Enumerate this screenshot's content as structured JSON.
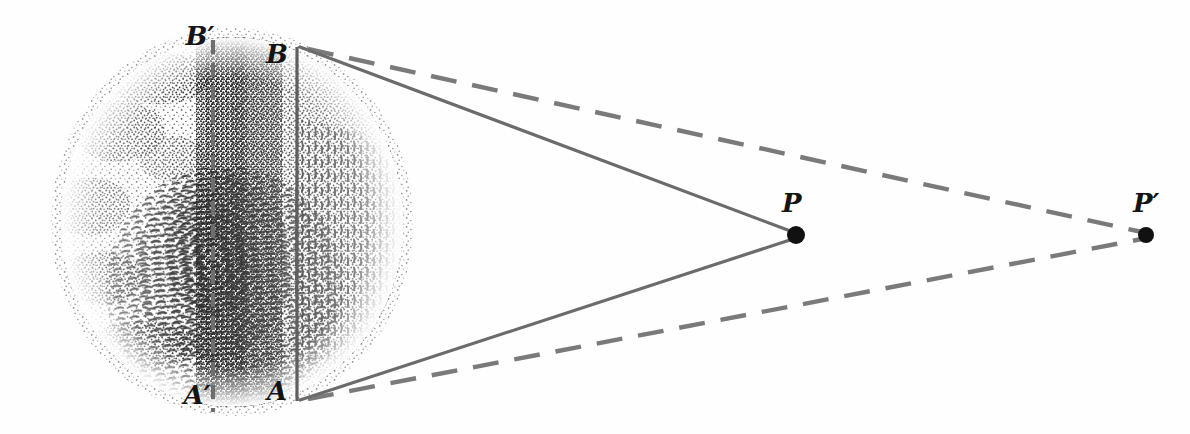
{
  "figure": {
    "background_color": "#fefefe",
    "width": 1190,
    "height": 434
  },
  "colors": {
    "line_solid": "#6b6b6b",
    "line_dashed": "#7a7a7a",
    "label_text": "#141414",
    "stipple": "#1a1a1a",
    "point_fill": "#111111"
  },
  "labels": [
    {
      "id": "B-prime",
      "text": "B′",
      "x": 200,
      "y": 45,
      "size": 26
    },
    {
      "id": "B",
      "text": "B",
      "x": 277,
      "y": 63,
      "size": 26
    },
    {
      "id": "A-prime",
      "text": "A′",
      "x": 197,
      "y": 404,
      "size": 26
    },
    {
      "id": "A",
      "text": "A",
      "x": 277,
      "y": 400,
      "size": 26
    },
    {
      "id": "P",
      "text": "P",
      "x": 782,
      "y": 212,
      "size": 26
    },
    {
      "id": "P-prime",
      "text": "P′",
      "x": 1133,
      "y": 212,
      "size": 26
    }
  ],
  "points": [
    {
      "id": "point-P",
      "label": "P",
      "x": 796,
      "y": 235,
      "r": 9
    },
    {
      "id": "point-P-prime",
      "label": "P'",
      "x": 1146,
      "y": 235,
      "r": 8
    }
  ],
  "sphere": {
    "id": "earth-globe",
    "center_x": 232,
    "center_y": 222,
    "radius_x": 172,
    "radius_y": 185,
    "description": "stippled hemisphere of the Earth with landmasses"
  },
  "chords": [
    {
      "id": "chord-AB",
      "style": "solid",
      "x1": 297,
      "y1": 47,
      "x2": 297,
      "y2": 401
    },
    {
      "id": "chord-A-prime-B-prime",
      "style": "dashed",
      "x1": 213,
      "y1": 40,
      "x2": 213,
      "y2": 412
    }
  ],
  "sight_lines": [
    {
      "id": "sight-B-to-P",
      "style": "solid",
      "x1": 300,
      "y1": 47,
      "x2": 793,
      "y2": 232
    },
    {
      "id": "sight-A-to-P",
      "style": "solid",
      "x1": 300,
      "y1": 400,
      "x2": 793,
      "y2": 239
    },
    {
      "id": "sight-B-to-P-prime",
      "style": "dashed",
      "x1": 308,
      "y1": 49,
      "x2": 1142,
      "y2": 232
    },
    {
      "id": "sight-A-to-P-prime",
      "style": "dashed",
      "x1": 308,
      "y1": 399,
      "x2": 1142,
      "y2": 239
    }
  ],
  "line_style": {
    "solid_width": 3.2,
    "dashed_width": 4.4,
    "dash_pattern": "26 16",
    "chord_dash_pattern": "14 9"
  }
}
